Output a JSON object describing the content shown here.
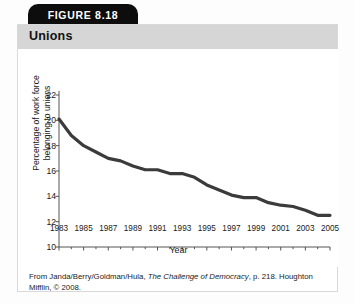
{
  "figure": {
    "tab_label": "FIGURE 8.18",
    "title": "Unions",
    "citation_prefix": "From Janda/Berry/Goldman/Hula, ",
    "citation_italic": "The Challenge of Democracy",
    "citation_suffix": ", p. 218. Houghton Mifflin, © 2008."
  },
  "colors": {
    "tab_background": "#0d0d0d",
    "tab_text": "#ffffff",
    "titlebar_background": "#d6d6d6",
    "card_background": "#ffffff",
    "card_border": "#d9d9d9",
    "line": "#3b3b3b",
    "axis": "#555555",
    "text": "#1a1a1a"
  },
  "chart_data": {
    "type": "line",
    "title": "Unions",
    "xlabel": "Year",
    "ylabel": "Percentage of work force belonging to unions",
    "ylabel_line1": "Percentage of work force",
    "ylabel_line2": "belonging to unions",
    "xlim": [
      1983,
      2005
    ],
    "ylim": [
      10,
      22
    ],
    "yticks": [
      22,
      20,
      18,
      16,
      14,
      12,
      10
    ],
    "xticks": [
      1983,
      1985,
      1987,
      1989,
      1991,
      1993,
      1995,
      1997,
      1999,
      2001,
      2003,
      2005
    ],
    "minor_xtick_interval": 1,
    "grid": false,
    "legend": null,
    "series": [
      {
        "name": "Percentage of work force belonging to unions",
        "x": [
          1983,
          1984,
          1985,
          1986,
          1987,
          1988,
          1989,
          1990,
          1991,
          1992,
          1993,
          1994,
          1995,
          1996,
          1997,
          1998,
          1999,
          2000,
          2001,
          2002,
          2003,
          2004,
          2005
        ],
        "values": [
          20.1,
          18.8,
          18.0,
          17.5,
          17.0,
          16.8,
          16.4,
          16.1,
          16.1,
          15.8,
          15.8,
          15.5,
          14.9,
          14.5,
          14.1,
          13.9,
          13.9,
          13.5,
          13.3,
          13.2,
          12.9,
          12.5,
          12.5
        ]
      }
    ]
  }
}
